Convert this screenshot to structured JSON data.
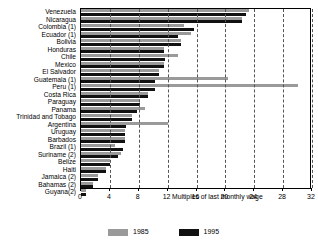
{
  "chart_data": {
    "type": "bar",
    "orientation": "horizontal",
    "title": "",
    "xlabel": "Multiples of last monthly wage",
    "ylabel": "",
    "xlim": [
      0,
      32
    ],
    "xticks": [
      0,
      4,
      8,
      12,
      16,
      20,
      24,
      28,
      32
    ],
    "grid": true,
    "legend_position": "bottom",
    "categories": [
      "Venezuela",
      "Nicaragua",
      "Colombia (1)",
      "Ecuador (1)",
      "Bolivia",
      "Honduras",
      "Chile",
      "Mexico",
      "El Salvador",
      "Guatemala (1)",
      "Peru (1)",
      "Costa Rica",
      "Paraguay",
      "Panama",
      "Trinidad and Tobago",
      "Argentina",
      "Uruguay",
      "Barbados",
      "Brazil (1)",
      "Suriname (2)",
      "Belize",
      "Haiti",
      "Jamaica (2)",
      "Bahamas (2)",
      "Guyana(2)"
    ],
    "series": [
      {
        "name": "1985",
        "color": "#9a9a9a",
        "values": [
          23.3,
          22.3,
          14.3,
          15.3,
          13.8,
          11.5,
          13.4,
          11.5,
          10.8,
          20.4,
          30.1,
          9.3,
          8.2,
          8.9,
          7.0,
          12.0,
          6.1,
          6.1,
          4.7,
          5.6,
          4.0,
          3.5,
          2.3,
          1.6,
          0.7
        ]
      },
      {
        "name": "1995",
        "color": "#111111",
        "values": [
          22.8,
          22.3,
          15.7,
          13.4,
          13.8,
          11.5,
          11.7,
          11.5,
          10.8,
          10.3,
          10.3,
          9.3,
          8.2,
          7.7,
          7.0,
          6.3,
          6.1,
          6.1,
          5.8,
          5.1,
          4.0,
          3.5,
          2.3,
          1.6,
          0.7
        ]
      }
    ]
  },
  "legend": {
    "items": [
      {
        "label": "1985"
      },
      {
        "label": "1995"
      }
    ]
  }
}
